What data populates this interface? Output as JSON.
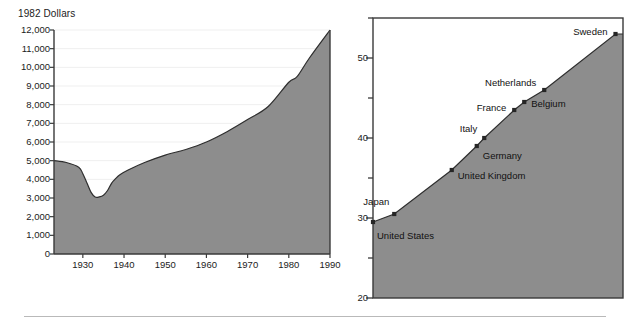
{
  "figure": {
    "background_color": "#ffffff",
    "area_fill_color": "#8d8d8d",
    "line_color": "#2e2e2e",
    "axis_color": "#3a3a3a",
    "grid_color": "#efefef",
    "footer_rule_color": "#b9b9b9"
  },
  "chart_data": [
    {
      "id": "real-gdp-per-capita",
      "type": "area",
      "title": "1982 Dollars",
      "xlabel": "",
      "ylabel": "1982 Dollars",
      "grid": true,
      "legend": "none",
      "xlim": [
        1923,
        1990
      ],
      "ylim": [
        0,
        12000
      ],
      "xticks": [
        1930,
        1940,
        1950,
        1960,
        1970,
        1980,
        1990
      ],
      "xtick_labels": [
        "1930",
        "1940",
        "1950",
        "1960",
        "1970",
        "1980",
        "1990"
      ],
      "yticks": [
        0,
        1000,
        2000,
        3000,
        4000,
        5000,
        6000,
        7000,
        8000,
        9000,
        10000,
        11000,
        12000
      ],
      "ytick_labels": [
        "0",
        "1,000",
        "2,000",
        "3,000",
        "4,000",
        "5,000",
        "6,000",
        "7,000",
        "8,000",
        "9,000",
        "10,000",
        "11,000",
        "12,000"
      ],
      "x": [
        1923,
        1926,
        1929,
        1930,
        1931,
        1932,
        1933,
        1934,
        1935,
        1936,
        1937,
        1938,
        1939,
        1941,
        1945,
        1950,
        1955,
        1960,
        1965,
        1970,
        1975,
        1980,
        1982,
        1985,
        1990
      ],
      "values": [
        5000,
        4900,
        4650,
        4300,
        3800,
        3300,
        3050,
        3060,
        3150,
        3400,
        3800,
        4050,
        4250,
        4500,
        4900,
        5300,
        5600,
        6000,
        6550,
        7200,
        7900,
        9200,
        9500,
        10500,
        12000
      ],
      "series": [
        {
          "name": "Real GDP per capita",
          "values": [
            5000,
            4900,
            4650,
            4300,
            3800,
            3300,
            3050,
            3060,
            3150,
            3400,
            3800,
            4050,
            4250,
            4500,
            4900,
            5300,
            5600,
            6000,
            6550,
            7200,
            7900,
            9200,
            9500,
            10500,
            12000
          ]
        }
      ]
    },
    {
      "id": "country-comparison",
      "type": "area",
      "title": "",
      "xlabel": "",
      "ylabel": "",
      "grid": false,
      "legend": "point-labels",
      "ylim": [
        20,
        55
      ],
      "yticks": [
        20,
        25,
        30,
        35,
        40,
        45,
        50,
        55
      ],
      "ytick_labels": [
        "20",
        "",
        "30",
        "",
        "40",
        "",
        "50",
        ""
      ],
      "major_yticks": [
        20,
        30,
        40,
        50
      ],
      "categories": [
        "United States",
        "Japan",
        "United Kingdom",
        "Germany",
        "Italy",
        "France",
        "Belgium",
        "Netherlands",
        "Sweden"
      ],
      "values": [
        29.5,
        30.5,
        36.0,
        39.0,
        40.0,
        43.5,
        44.5,
        46.0,
        53.0
      ],
      "points": [
        {
          "label": "United States",
          "value": 29.5,
          "label_position": "below-right"
        },
        {
          "label": "Japan",
          "value": 30.5,
          "label_position": "above-left"
        },
        {
          "label": "United Kingdom",
          "value": 36.0,
          "label_position": "right"
        },
        {
          "label": "Germany",
          "value": 39.0,
          "label_position": "below-right"
        },
        {
          "label": "Italy",
          "value": 40.0,
          "label_position": "above-left"
        },
        {
          "label": "France",
          "value": 43.5,
          "label_position": "left"
        },
        {
          "label": "Belgium",
          "value": 44.5,
          "label_position": "right"
        },
        {
          "label": "Netherlands",
          "value": 46.0,
          "label_position": "above-left"
        },
        {
          "label": "Sweden",
          "value": 53.0,
          "label_position": "left"
        }
      ]
    }
  ]
}
